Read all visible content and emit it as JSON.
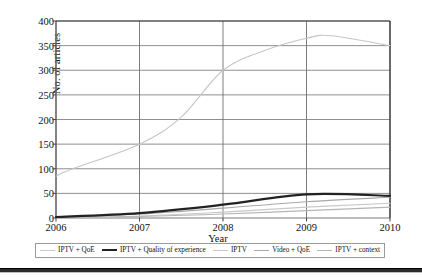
{
  "chart_data": {
    "type": "line",
    "title": "",
    "xlabel": "Year",
    "ylabel": "No. of articles",
    "xlim": [
      2006,
      2010
    ],
    "ylim": [
      0,
      400
    ],
    "ytick_labels": [
      "0",
      "50",
      "100",
      "150",
      "200",
      "250",
      "300",
      "350",
      "400"
    ],
    "ytick_values": [
      0,
      50,
      100,
      150,
      200,
      250,
      300,
      350,
      400
    ],
    "xtick_labels": [
      "2006",
      "2007",
      "2008",
      "2009",
      "2010"
    ],
    "xtick_values": [
      2006,
      2007,
      2008,
      2009,
      2010
    ],
    "grid": "both",
    "legend_position": "bottom",
    "series": [
      {
        "name": "IPTV + QoE",
        "color": "#c9c9c9",
        "width": 1.1,
        "x": [
          2006,
          2007,
          2008,
          2009,
          2010
        ],
        "values": [
          1,
          4,
          12,
          22,
          30
        ]
      },
      {
        "name": "IPTV + Quality of experience",
        "color": "#222222",
        "width": 2.2,
        "x": [
          2006,
          2007,
          2008,
          2009,
          2010
        ],
        "values": [
          2,
          10,
          27,
          48,
          45
        ]
      },
      {
        "name": "IPTV",
        "color": "#c6c6c6",
        "width": 1.1,
        "x": [
          2006,
          2006.2,
          2007,
          2007.5,
          2008,
          2008.5,
          2009,
          2009.3,
          2010
        ],
        "values": [
          85,
          100,
          150,
          205,
          300,
          340,
          365,
          370,
          350
        ]
      },
      {
        "name": "Video + QoE",
        "color": "#a8a8a8",
        "width": 1.1,
        "x": [
          2006,
          2007,
          2008,
          2009,
          2010
        ],
        "values": [
          2,
          8,
          20,
          33,
          42
        ]
      },
      {
        "name": "IPTV + context",
        "color": "#b5b5b5",
        "width": 1.1,
        "x": [
          2006,
          2007,
          2008,
          2009,
          2010
        ],
        "values": [
          1,
          3,
          8,
          15,
          22
        ]
      }
    ]
  },
  "axes": {
    "ylabel": "No. of articles",
    "xlabel": "Year"
  }
}
